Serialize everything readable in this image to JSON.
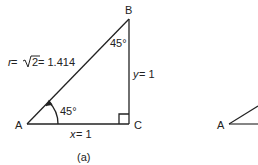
{
  "diagram": {
    "figure_a": {
      "caption": "(a)",
      "vertices": {
        "A": "A",
        "B": "B",
        "C": "C"
      },
      "hypotenuse_label": {
        "var": "r",
        "eq": " = ",
        "sqrt_arg": "2",
        "value": " = 1.414"
      },
      "vertical_side_label": {
        "var": "y",
        "value": " = 1"
      },
      "horizontal_side_label": {
        "var": "x",
        "value": " = 1"
      },
      "angle_at_A": "45°",
      "angle_at_B": "45°"
    },
    "figure_b_partial": {
      "vertex_label": "A"
    }
  }
}
